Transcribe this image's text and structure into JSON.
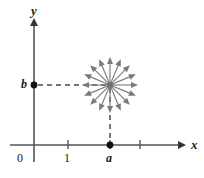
{
  "figure": {
    "type": "vector-field-diagram",
    "background_color": "#ffffff",
    "axis_color": "#555555",
    "arrow_color": "#7a7a7a",
    "dash_color": "#4a4a4a",
    "text_color": "#1a1a1a"
  },
  "axes": {
    "x_label": "x",
    "y_label": "y",
    "origin_label": "0",
    "x_axis": {
      "y_px": 145,
      "x_start_px": 10,
      "x_end_px": 184
    },
    "y_axis": {
      "x_px": 34,
      "y_top_px": 18,
      "y_bottom_px": 162
    },
    "x_ticks": [
      {
        "label": "1",
        "x_px": 68
      },
      {
        "label": "",
        "x_px": 110
      },
      {
        "label": "",
        "x_px": 140
      }
    ],
    "y_ticks": [
      {
        "label": "b",
        "y_px": 85
      }
    ]
  },
  "points": {
    "a": {
      "label": "a",
      "x_px": 110,
      "y_px": 145,
      "on_axis": "x"
    },
    "b": {
      "label": "b",
      "x_px": 34,
      "y_px": 85,
      "on_axis": "y"
    },
    "center": {
      "x_px": 110,
      "y_px": 85
    }
  },
  "guides": [
    {
      "name": "horizontal-dashed-guide",
      "from_x": 38,
      "from_y": 85,
      "to_x": 108,
      "to_y": 85
    },
    {
      "name": "vertical-dashed-guide",
      "from_x": 110,
      "from_y": 88,
      "to_x": 110,
      "to_y": 142
    }
  ],
  "starburst": {
    "count": 16,
    "angle_step_deg": 22.5,
    "inner_radius_px": 2,
    "outer_radius_px": 28,
    "head_length_px": 7,
    "head_width_px": 6,
    "angles_deg": [
      0,
      22.5,
      45,
      67.5,
      90,
      112.5,
      135,
      157.5,
      180,
      202.5,
      225,
      247.5,
      270,
      292.5,
      315,
      337.5
    ]
  }
}
